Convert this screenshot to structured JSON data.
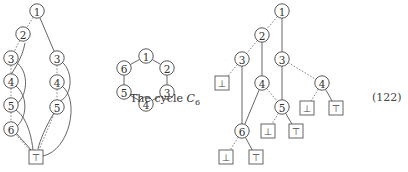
{
  "caption": {
    "prefix": "The cycle ",
    "symbol": "C",
    "subscript": "6"
  },
  "equation_number": "(122)",
  "symbols": {
    "top": "⊤",
    "bottom": "⊥"
  },
  "diagrams": {
    "left": {
      "description": "Tree-with-merged-terminal diagram",
      "nodes": [
        {
          "id": "L1",
          "label": "1",
          "type": "circle",
          "x": 37,
          "y": 11
        },
        {
          "id": "L2",
          "label": "2",
          "type": "circle",
          "x": 23,
          "y": 34
        },
        {
          "id": "L3a",
          "label": "3",
          "type": "circle",
          "x": 11,
          "y": 58
        },
        {
          "id": "L4a",
          "label": "4",
          "type": "circle",
          "x": 11,
          "y": 81
        },
        {
          "id": "L5a",
          "label": "5",
          "type": "circle",
          "x": 11,
          "y": 105
        },
        {
          "id": "L6",
          "label": "6",
          "type": "circle",
          "x": 11,
          "y": 129
        },
        {
          "id": "L3b",
          "label": "3",
          "type": "circle",
          "x": 57,
          "y": 58
        },
        {
          "id": "L4b",
          "label": "4",
          "type": "circle",
          "x": 57,
          "y": 82
        },
        {
          "id": "L5b",
          "label": "5",
          "type": "circle",
          "x": 57,
          "y": 107
        },
        {
          "id": "LT",
          "label": "⊤",
          "type": "box",
          "x": 36,
          "y": 157
        }
      ],
      "edges": [
        {
          "from": "L1",
          "to": "L2",
          "style": "dashed"
        },
        {
          "from": "L1",
          "to": "L3b",
          "style": "solid"
        },
        {
          "from": "L2",
          "to": "L3a",
          "style": "dashed"
        },
        {
          "from": "L3a",
          "to": "L4a",
          "style": "dashed"
        },
        {
          "from": "L4a",
          "to": "L5a",
          "style": "dashed"
        },
        {
          "from": "L5a",
          "to": "L6",
          "style": "dashed"
        },
        {
          "from": "L3b",
          "to": "L4b",
          "style": "dashed"
        },
        {
          "from": "L4b",
          "to": "L5b",
          "style": "dashed"
        },
        {
          "from": "L6",
          "to": "LT",
          "style": "dashed"
        },
        {
          "from": "L5b",
          "to": "LT",
          "style": "dashed"
        }
      ],
      "curves": [
        {
          "d": "M25,43 C22,60 12,72 8,80",
          "style": "solid"
        },
        {
          "d": "M16,62 C30,72 28,98 14,106",
          "style": "solid"
        },
        {
          "d": "M16,86 C28,96 28,118 15,128",
          "style": "solid"
        },
        {
          "d": "M16,110 C28,118 32,140 33,150",
          "style": "solid"
        },
        {
          "d": "M16,133 C22,140 28,146 31,150",
          "style": "solid"
        },
        {
          "d": "M62,62 C74,72 72,96 60,101",
          "style": "solid"
        },
        {
          "d": "M62,86 C80,100 70,150 43,156",
          "style": "solid"
        },
        {
          "d": "M54,113 C46,126 40,140 38,149",
          "style": "solid"
        }
      ]
    },
    "middle": {
      "description": "The cycle C6",
      "nodes": [
        {
          "id": "C1",
          "label": "1",
          "type": "circle",
          "x": 146,
          "y": 56
        },
        {
          "id": "C2",
          "label": "2",
          "type": "circle",
          "x": 167,
          "y": 68
        },
        {
          "id": "C3",
          "label": "3",
          "type": "circle",
          "x": 167,
          "y": 92
        },
        {
          "id": "C4",
          "label": "4",
          "type": "circle",
          "x": 146,
          "y": 104
        },
        {
          "id": "C5",
          "label": "5",
          "type": "circle",
          "x": 124,
          "y": 92
        },
        {
          "id": "C6",
          "label": "6",
          "type": "circle",
          "x": 124,
          "y": 68
        }
      ],
      "edges": [
        {
          "from": "C1",
          "to": "C2",
          "style": "solid"
        },
        {
          "from": "C2",
          "to": "C3",
          "style": "solid"
        },
        {
          "from": "C3",
          "to": "C4",
          "style": "solid"
        },
        {
          "from": "C4",
          "to": "C5",
          "style": "solid"
        },
        {
          "from": "C5",
          "to": "C6",
          "style": "solid"
        },
        {
          "from": "C6",
          "to": "C1",
          "style": "solid"
        }
      ],
      "curves": []
    },
    "right": {
      "description": "Decision tree with terminals",
      "nodes": [
        {
          "id": "R1",
          "label": "1",
          "type": "circle",
          "x": 282,
          "y": 11
        },
        {
          "id": "R2",
          "label": "2",
          "type": "circle",
          "x": 262,
          "y": 35
        },
        {
          "id": "R3a",
          "label": "3",
          "type": "circle",
          "x": 242,
          "y": 59
        },
        {
          "id": "R3b",
          "label": "3",
          "type": "circle",
          "x": 282,
          "y": 59
        },
        {
          "id": "Rb1",
          "label": "⊥",
          "type": "box",
          "x": 222,
          "y": 83
        },
        {
          "id": "R4a",
          "label": "4",
          "type": "circle",
          "x": 262,
          "y": 83
        },
        {
          "id": "R4b",
          "label": "4",
          "type": "circle",
          "x": 322,
          "y": 83
        },
        {
          "id": "R5",
          "label": "5",
          "type": "circle",
          "x": 282,
          "y": 107
        },
        {
          "id": "Rb2",
          "label": "⊥",
          "type": "box",
          "x": 307,
          "y": 108
        },
        {
          "id": "Rt2",
          "label": "⊤",
          "type": "box",
          "x": 336,
          "y": 108
        },
        {
          "id": "R6",
          "label": "6",
          "type": "circle",
          "x": 242,
          "y": 131
        },
        {
          "id": "Rb3",
          "label": "⊥",
          "type": "box",
          "x": 268,
          "y": 131
        },
        {
          "id": "Rt3",
          "label": "⊤",
          "type": "box",
          "x": 296,
          "y": 131
        },
        {
          "id": "Rb4",
          "label": "⊥",
          "type": "box",
          "x": 226,
          "y": 157
        },
        {
          "id": "Rt4",
          "label": "⊤",
          "type": "box",
          "x": 256,
          "y": 157
        }
      ],
      "edges": [
        {
          "from": "R1",
          "to": "R2",
          "style": "dashed"
        },
        {
          "from": "R1",
          "to": "R3b",
          "style": "solid"
        },
        {
          "from": "R2",
          "to": "R3a",
          "style": "dashed"
        },
        {
          "from": "R2",
          "to": "R4a",
          "style": "solid"
        },
        {
          "from": "R3a",
          "to": "Rb1",
          "style": "dashed"
        },
        {
          "from": "R3a",
          "to": "R6",
          "style": "solid"
        },
        {
          "from": "R3b",
          "to": "R4b",
          "style": "dashed"
        },
        {
          "from": "R3b",
          "to": "R5",
          "style": "solid"
        },
        {
          "from": "R4a",
          "to": "R5",
          "style": "dashed"
        },
        {
          "from": "R4a",
          "to": "R6",
          "style": "solid"
        },
        {
          "from": "R4b",
          "to": "Rb2",
          "style": "dashed"
        },
        {
          "from": "R4b",
          "to": "Rt2",
          "style": "solid"
        },
        {
          "from": "R5",
          "to": "Rb3",
          "style": "dashed"
        },
        {
          "from": "R5",
          "to": "Rt3",
          "style": "solid"
        },
        {
          "from": "R6",
          "to": "Rb4",
          "style": "dashed"
        },
        {
          "from": "R6",
          "to": "Rt4",
          "style": "solid"
        }
      ],
      "curves": []
    }
  }
}
